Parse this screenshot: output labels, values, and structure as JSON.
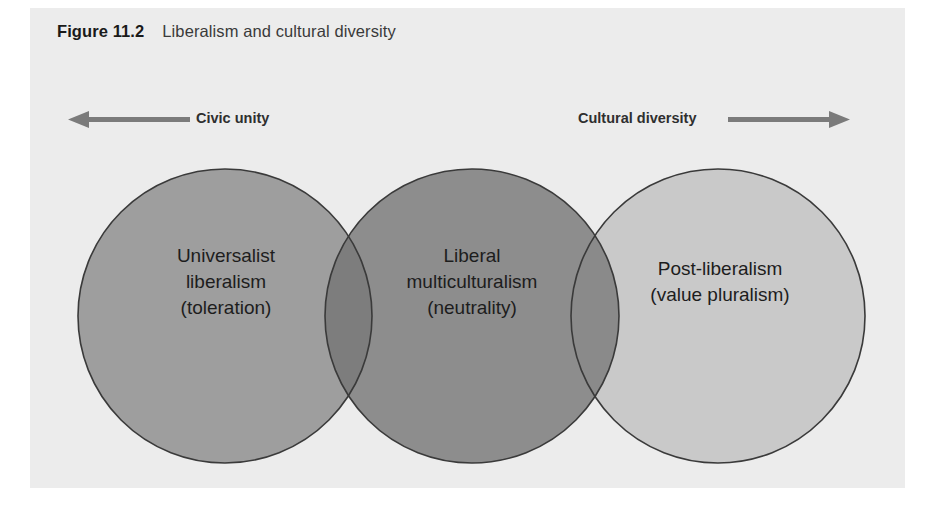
{
  "figure": {
    "number": "Figure 11.2",
    "title": "Liberalism and cultural diversity"
  },
  "axis": {
    "left": {
      "label": "Civic unity",
      "icon": "arrow-left-icon",
      "direction": "left"
    },
    "right": {
      "label": "Cultural diversity",
      "icon": "arrow-right-icon",
      "direction": "right"
    }
  },
  "diagram": {
    "type": "venn-three-circle-linear",
    "circles": [
      {
        "id": "universalist-liberalism",
        "lines": [
          "Universalist",
          "liberalism",
          "(toleration)"
        ],
        "fill": "#9e9e9e",
        "stroke": "#3a3a3a"
      },
      {
        "id": "liberal-multiculturalism",
        "lines": [
          "Liberal",
          "multiculturalism",
          "(neutrality)"
        ],
        "fill": "#8d8d8d",
        "stroke": "#3a3a3a"
      },
      {
        "id": "post-liberalism",
        "lines": [
          "Post-liberalism",
          "(value pluralism)"
        ],
        "fill": "#c9c9c9",
        "stroke": "#3a3a3a"
      }
    ],
    "overlaps": [
      {
        "id": "overlap-left-middle",
        "fill": "#7d7d7d"
      },
      {
        "id": "overlap-middle-right",
        "fill": "#8a8a8a"
      }
    ]
  },
  "colors": {
    "panel_background": "#ececec",
    "page_background": "#ffffff",
    "arrow": "#7b7b7b",
    "text": "#1d1d1d"
  }
}
